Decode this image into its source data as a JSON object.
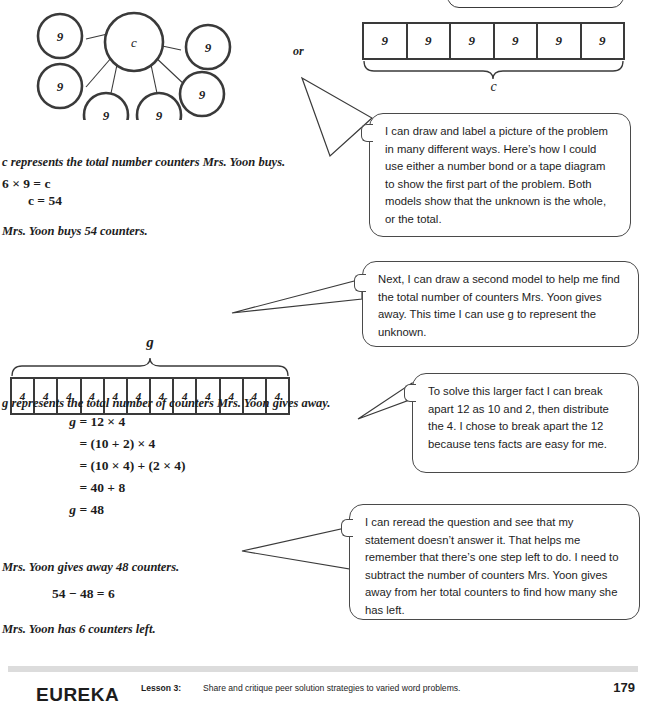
{
  "number_bond": {
    "name": "number-bond-diagram",
    "whole_label": "c",
    "part_labels": [
      "9",
      "9",
      "9",
      "9",
      "9",
      "9"
    ]
  },
  "or_label": "or",
  "tape_c": {
    "name": "tape-diagram-c",
    "cells": [
      "9",
      "9",
      "9",
      "9",
      "9",
      "9"
    ],
    "brace_label": "c",
    "brace_position": "below"
  },
  "tape_g": {
    "name": "tape-diagram-g",
    "cells": [
      "4",
      "4",
      "4",
      "4",
      "4",
      "4",
      "4",
      "4",
      "4",
      "4",
      "4",
      "4"
    ],
    "brace_label": "g",
    "brace_position": "above"
  },
  "solution_c": {
    "statement_variable": "c represents the total number counters Mrs. Yoon buys.",
    "equation_1": "6 × 9 = c",
    "equation_2": "c = 54",
    "answer_statement": "Mrs. Yoon buys 54 counters."
  },
  "solution_g": {
    "statement_variable": "g represents the total number of counters Mrs. Yoon gives away.",
    "steps": [
      {
        "lead": "g",
        "body": "= 12 × 4"
      },
      {
        "lead": "",
        "body": "= (10 + 2) × 4"
      },
      {
        "lead": "",
        "body": "= (10 × 4) + (2 × 4)"
      },
      {
        "lead": "",
        "body": "= 40 + 8"
      },
      {
        "lead": "g",
        "body": "= 48"
      }
    ],
    "answer_statement": "Mrs. Yoon gives away 48 counters.",
    "subtraction": "54 − 48 = 6",
    "final_statement": "Mrs. Yoon has 6 counters left."
  },
  "bubbles": [
    {
      "id": "bubble-1",
      "text": "I can draw and label a picture of the problem in many different ways.  Here’s how I could use either a number bond or a tape diagram to show the first part of the problem.  Both models show that the unknown is the whole, or the total."
    },
    {
      "id": "bubble-2",
      "text": "Next, I can draw a second model to help me find the total number of counters Mrs. Yoon gives away.  This time I can use g to represent the unknown."
    },
    {
      "id": "bubble-3",
      "text": "To solve this larger fact I can break apart 12 as 10 and 2, then distribute the 4.  I chose to break apart the 12 because tens facts are easy for me."
    },
    {
      "id": "bubble-4",
      "text": "I can reread the question and see that my statement doesn’t answer it.  That helps me remember that there’s one step left to do. I need to subtract the number of counters Mrs. Yoon gives away from her total counters to find how many she has left."
    }
  ],
  "footer": {
    "brand": "EUREKA",
    "lesson_label": "Lesson 3:",
    "lesson_description": "Share and critique peer solution strategies to varied word problems.",
    "page_number": "179"
  },
  "colors": {
    "ink": "#1d1d1d",
    "stroke": "#3a3a3a",
    "bubble_stroke": "#4a4a4a",
    "footer_bar": "#dcdcdc"
  }
}
